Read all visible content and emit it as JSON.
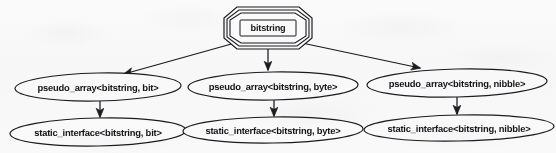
{
  "diagram": {
    "type": "class-hierarchy-graph",
    "stroke_color": "#1b1b20",
    "text_color": "#15151a",
    "background_color": "#fcfcfc",
    "root": {
      "id": "bitstring",
      "label": "bitstring",
      "shape": "tripled-octagon",
      "cx": 268,
      "cy": 28,
      "rx": 44,
      "ry": 19
    },
    "middle_row": [
      {
        "id": "pseudo-array-bit",
        "label": "pseudo_array<bitstring, bit>",
        "shape": "ellipse",
        "cx": 98,
        "cy": 87,
        "rx": 83,
        "ry": 14
      },
      {
        "id": "pseudo-array-byte",
        "label": "pseudo_array<bitstring, byte>",
        "shape": "ellipse",
        "cx": 273,
        "cy": 86,
        "rx": 85,
        "ry": 14
      },
      {
        "id": "pseudo-array-nibble",
        "label": "pseudo_array<bitstring, nibble>",
        "shape": "ellipse",
        "cx": 457,
        "cy": 83,
        "rx": 90,
        "ry": 14
      }
    ],
    "bottom_row": [
      {
        "id": "static-interface-bit",
        "label": "static_interface<bitstring, bit>",
        "shape": "ellipse",
        "cx": 98,
        "cy": 132,
        "rx": 88,
        "ry": 14
      },
      {
        "id": "static-interface-byte",
        "label": "static_interface<bitstring, byte>",
        "shape": "ellipse",
        "cx": 273,
        "cy": 130,
        "rx": 90,
        "ry": 13
      },
      {
        "id": "static-interface-nibble",
        "label": "static_interface<bitstring, nibble>",
        "shape": "ellipse",
        "cx": 459,
        "cy": 128,
        "rx": 95,
        "ry": 13
      }
    ],
    "edges": [
      {
        "id": "edge-root-to-bit",
        "from": "bitstring",
        "to": "pseudo-array-bit",
        "style": "solid-arrow",
        "direction": "diagonal-left"
      },
      {
        "id": "edge-root-to-byte",
        "from": "bitstring",
        "to": "pseudo-array-byte",
        "style": "solid-arrow",
        "direction": "vertical"
      },
      {
        "id": "edge-root-to-nibble",
        "from": "bitstring",
        "to": "pseudo-array-nibble",
        "style": "solid-arrow",
        "direction": "diagonal-right"
      },
      {
        "id": "edge-bit-chain",
        "from": "pseudo-array-bit",
        "to": "static-interface-bit",
        "style": "solid-arrow",
        "direction": "vertical"
      },
      {
        "id": "edge-byte-chain",
        "from": "pseudo-array-byte",
        "to": "static-interface-byte",
        "style": "solid-arrow",
        "direction": "vertical"
      },
      {
        "id": "edge-nibble-chain",
        "from": "pseudo-array-nibble",
        "to": "static-interface-nibble",
        "style": "solid-arrow",
        "direction": "vertical"
      }
    ]
  }
}
